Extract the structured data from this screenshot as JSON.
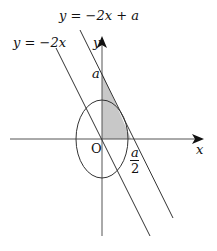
{
  "labels": {
    "line1": "y = −2x + a",
    "line2": "y = −2x",
    "y_axis": "y",
    "x_axis": "x",
    "origin": "O",
    "y_intercept": "a",
    "x_intercept_num": "a",
    "x_intercept_den": "2"
  },
  "colors": {
    "stroke": "#222222",
    "shade": "#c8c8c8"
  }
}
